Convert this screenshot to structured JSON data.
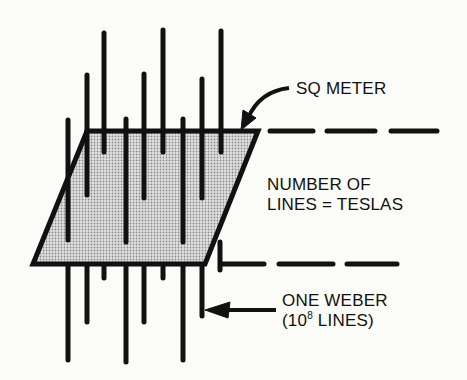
{
  "diagram": {
    "labels": {
      "area": "SQ METER",
      "density_line1": "NUMBER OF",
      "density_line2": "LINES = TESLAS",
      "flux_line1": "ONE WEBER",
      "flux_line2_pre": "(10",
      "flux_line2_exp": "8",
      "flux_line2_post": " LINES)"
    },
    "colors": {
      "ink": "#111111",
      "fill": "#c8c8c8",
      "background": "#fbfbf8"
    }
  }
}
